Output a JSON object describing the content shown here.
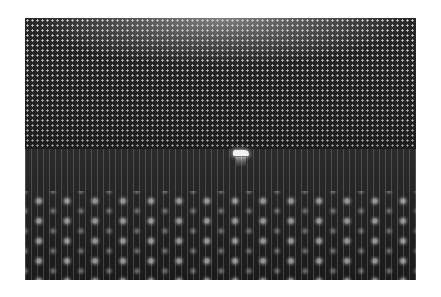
{
  "image": {
    "description": "Black-and-white photograph of the interior of a large cylindrical neutrino detector lined with thousands of photomultiplier tubes, with a small boat carrying people in the center",
    "colors": {
      "page_background": "#ffffff",
      "photo_dark": "#1e1e1e",
      "tube_highlight": "#cfcfcf",
      "boat": "#f2f2f2"
    }
  }
}
